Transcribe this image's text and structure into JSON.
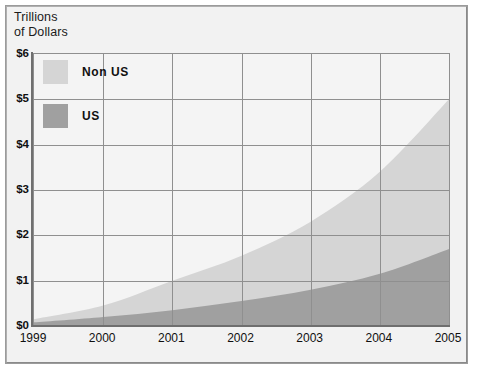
{
  "axis_title": "Trillions\nof Dollars",
  "legend": {
    "items": [
      {
        "label": "Non US",
        "color": "#d5d5d5"
      },
      {
        "label": "US",
        "color": "#a0a0a0"
      }
    ]
  },
  "chart_data": {
    "type": "area",
    "stacked": true,
    "title": "",
    "subtitle": "",
    "xlabel": "",
    "ylabel": "Trillions of Dollars",
    "grid": true,
    "legend_position": "top-left",
    "x": [
      1999,
      2000,
      2001,
      2002,
      2003,
      2004,
      2005
    ],
    "categories": [
      "1999",
      "2000",
      "2001",
      "2002",
      "2003",
      "2004",
      "2005"
    ],
    "xtick_labels": [
      "1999",
      "2000",
      "2001",
      "2002",
      "2003",
      "2004",
      "2005"
    ],
    "ytick_labels": [
      "$0",
      "$1",
      "$2",
      "$3",
      "$4",
      "$5",
      "$6"
    ],
    "ytick_values": [
      0,
      1,
      2,
      3,
      4,
      5,
      6
    ],
    "ylim": [
      0,
      6
    ],
    "xlim": [
      1999,
      2005
    ],
    "series": [
      {
        "name": "US",
        "color": "#a0a0a0",
        "values": [
          0.08,
          0.2,
          0.35,
          0.55,
          0.8,
          1.15,
          1.7
        ]
      },
      {
        "name": "Non US",
        "color": "#d5d5d5",
        "values": [
          0.07,
          0.25,
          0.65,
          1.0,
          1.5,
          2.25,
          3.3
        ]
      }
    ],
    "totals": [
      0.15,
      0.45,
      1.0,
      1.55,
      2.3,
      3.4,
      5.0
    ]
  }
}
